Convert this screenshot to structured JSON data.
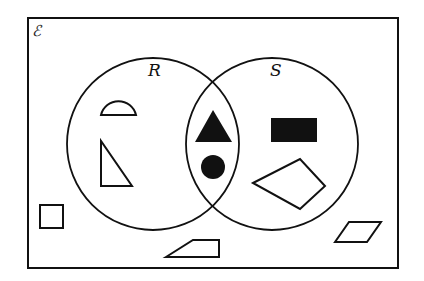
{
  "diagram": {
    "type": "venn",
    "universal_set_label": "ℰ",
    "sets": [
      {
        "name": "R",
        "label": "R"
      },
      {
        "name": "S",
        "label": "S"
      }
    ],
    "regions": {
      "R_only": [
        "semicircle (outline)",
        "right triangle (outline)"
      ],
      "R_and_S": [
        "triangle (filled)",
        "circle (filled)"
      ],
      "S_only": [
        "rectangle (filled)",
        "kite quadrilateral (outline)"
      ],
      "outside": [
        "square (outline)",
        "trapezium (outline)",
        "parallelogram (outline)"
      ]
    },
    "colors": {
      "stroke": "#111111",
      "fill": "#111111",
      "background": "#ffffff"
    }
  }
}
